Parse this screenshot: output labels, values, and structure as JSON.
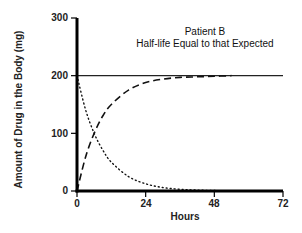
{
  "chart_data": {
    "type": "line",
    "title": "Patient B",
    "subtitle": "Half-life Equal to that Expected",
    "xlabel": "Hours",
    "ylabel": "Amount of Drug in the Body (mg)",
    "xlim": [
      0,
      72
    ],
    "ylim": [
      0,
      300
    ],
    "x_ticks": [
      "0",
      "24",
      "48",
      "72"
    ],
    "y_ticks": [
      "0",
      "100",
      "200",
      "300"
    ],
    "grid": false,
    "legend": null,
    "reference_line": {
      "y": 200,
      "style": "solid",
      "x_range": [
        0,
        72
      ]
    },
    "series": [
      {
        "name": "Accumulation (approach to steady state)",
        "style": "dashed",
        "x": [
          0,
          3,
          6,
          9,
          12,
          18,
          24,
          30,
          36,
          42,
          48,
          54
        ],
        "values": [
          0,
          59,
          100,
          130,
          150,
          175,
          188,
          194,
          197,
          198,
          199,
          200
        ]
      },
      {
        "name": "Elimination (decay)",
        "style": "dotted",
        "x": [
          0,
          3,
          6,
          9,
          12,
          18,
          24,
          30,
          36,
          42,
          48,
          54,
          60
        ],
        "values": [
          200,
          141,
          100,
          71,
          50,
          25,
          12.5,
          6,
          3,
          1.6,
          0.8,
          0.4,
          0.2
        ]
      }
    ],
    "annotations": [
      "Curves intersect at ~100 mg near 6 hours (one half-life)"
    ]
  }
}
